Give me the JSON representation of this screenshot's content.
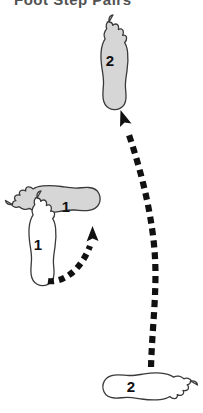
{
  "figure": {
    "title": "Foot Step Pairs",
    "title_clipped": true,
    "background_color": "#ffffff",
    "outline_color": "#3a3a3a",
    "shaded_fill": "#d6d6d6",
    "open_fill": "#ffffff",
    "arrow_color": "#111111",
    "label_color": "#101010"
  },
  "footprints": [
    {
      "id": "shaded-foot-2-top",
      "label": "2",
      "fill": "shaded",
      "orientation": "toes-up",
      "position": "top-center",
      "label_x": 110,
      "label_y": 62
    },
    {
      "id": "shaded-foot-1-left",
      "label": "1",
      "fill": "shaded",
      "orientation": "toes-left",
      "position": "mid-left",
      "label_x": 66,
      "label_y": 208
    },
    {
      "id": "open-foot-1-left",
      "label": "1",
      "fill": "open",
      "orientation": "toes-up",
      "position": "mid-left-lower",
      "label_x": 38,
      "label_y": 246
    },
    {
      "id": "open-foot-2-bottom",
      "label": "2",
      "fill": "open",
      "orientation": "toes-right",
      "position": "bottom-center",
      "label_x": 131,
      "label_y": 388
    }
  ],
  "arrows": [
    {
      "id": "arrow-step-1",
      "from": "open-foot-1-left",
      "to": "shaded-foot-1-left",
      "style": "dashed-curved",
      "head_direction": "up"
    },
    {
      "id": "arrow-step-2",
      "from": "open-foot-2-bottom",
      "to": "shaded-foot-2-top",
      "style": "dashed-curved",
      "head_direction": "up-left"
    }
  ]
}
